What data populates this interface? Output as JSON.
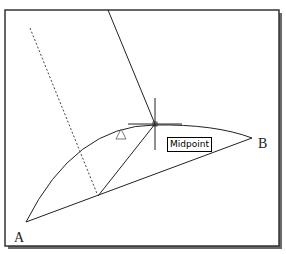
{
  "viewport": {
    "frame": {
      "x": 5,
      "y": 10,
      "width": 274,
      "height": 236,
      "border_color": "#333333",
      "shadow_color": "#555555"
    }
  },
  "drawing": {
    "points": {
      "A": {
        "label": "A",
        "x": 26,
        "y": 222,
        "label_x": 14,
        "label_y": 231
      },
      "B": {
        "label": "B",
        "x": 252,
        "y": 138,
        "label_x": 258,
        "label_y": 137
      }
    },
    "chord": {
      "from": "A",
      "to": "B"
    },
    "arc": {
      "from": "A",
      "through": [
        155,
        125
      ],
      "to": "B"
    },
    "chord_midpoint": {
      "x": 98,
      "y": 196
    },
    "dashed_line": {
      "x1": 30,
      "y1": 28,
      "x2": 98,
      "y2": 196
    },
    "midpoint_line": {
      "x1": 98,
      "y1": 196,
      "x2": 155,
      "y2": 124
    },
    "rubber_band_line": {
      "x1": 108,
      "y1": 10,
      "x2": 155,
      "y2": 124
    },
    "crosshair": {
      "x": 155,
      "y": 124,
      "size": 28
    },
    "snap_marker": {
      "shape": "triangle",
      "x": 121,
      "y": 134
    }
  },
  "tooltip": {
    "text": "Midpoint"
  },
  "icons": {
    "crosshair": "crosshair-cursor-icon",
    "snap_marker": "triangle-snap-marker-icon"
  },
  "colors": {
    "line": "#222222",
    "background": "#ffffff"
  }
}
